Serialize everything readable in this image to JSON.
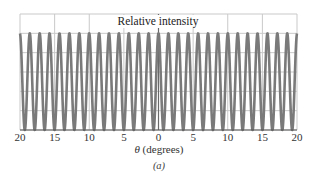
{
  "chart_data": {
    "type": "line",
    "title": "Relative intensity",
    "xlabel": "θ (degrees)",
    "xlabel_symbol": "θ",
    "xlabel_unit": "(degrees)",
    "ylabel": "Relative intensity",
    "caption": "(a)",
    "xlim": [
      -20,
      20
    ],
    "ylim": [
      0,
      1.2
    ],
    "x_ticks": [
      -20,
      -15,
      -10,
      -5,
      0,
      5,
      10,
      15,
      20
    ],
    "x_tick_labels": [
      "20",
      "15",
      "10",
      "5",
      "0",
      "5",
      "10",
      "15",
      "20"
    ],
    "y_gridlines": [
      0,
      0.2,
      0.4,
      0.6,
      0.8,
      1.0,
      1.2
    ],
    "grid": true,
    "legend": null,
    "series": [
      {
        "name": "Relative intensity",
        "formula": "cos^2(pi * theta / 1.43)",
        "fringe_spacing_deg": 1.43,
        "peak_value": 1.0,
        "min_value": 0.0,
        "peak_positions_deg": [
          -20.0,
          -18.6,
          -17.2,
          -15.7,
          -14.3,
          -12.9,
          -11.4,
          -10.0,
          -8.6,
          -7.2,
          -5.7,
          -4.3,
          -2.9,
          -1.4,
          0.0,
          1.4,
          2.9,
          4.3,
          5.7,
          7.2,
          8.6,
          10.0,
          11.4,
          12.9,
          14.3,
          15.7,
          17.2,
          18.6,
          20.0
        ],
        "color": "#7a7a7a"
      }
    ]
  },
  "style": {
    "curve_color": "#7a7a7a",
    "grid_color": "#c9c9c9",
    "axis_color": "#555555",
    "center_line_color": "#6a6a6a"
  }
}
